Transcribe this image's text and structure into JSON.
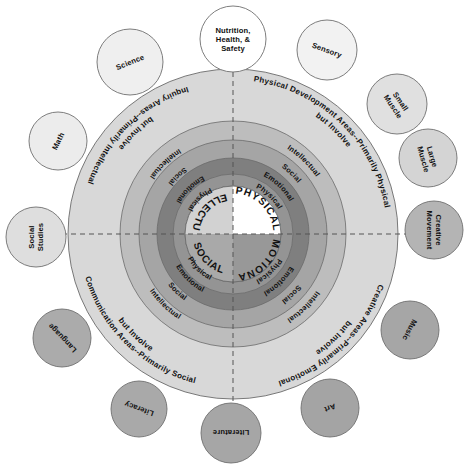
{
  "diagram": {
    "center": {
      "cx": 233,
      "cy": 234
    },
    "core_quadrants": [
      {
        "id": "intellectual",
        "label": "INTELLECTUAL",
        "position": "top-left",
        "color": "#d2d2d2"
      },
      {
        "id": "physical",
        "label": "PHYSICAL",
        "position": "top-right",
        "color": "#ffffff"
      },
      {
        "id": "social",
        "label": "SOCIAL",
        "position": "bottom-left",
        "color": "#a9a9a9"
      },
      {
        "id": "emotional",
        "label": "EMOTIONAL",
        "position": "bottom-right",
        "color": "#989898"
      }
    ],
    "quadrant_sectors": [
      {
        "id": "inquiry",
        "position": "top-left",
        "outer_label": "Inquiry Areas--Primarily Intellectual but Involve",
        "outer_label_line1": "Inquiry Areas--Primarily Intellectual",
        "outer_label_line2": "but Involve",
        "rings_inner_to_outer": [
          "Physical",
          "Emotional",
          "Social",
          "Intellectual"
        ]
      },
      {
        "id": "physical-development",
        "position": "top-right",
        "outer_label": "Physical Development Areas--Primarily Physical but Involve",
        "outer_label_line1": "Physical Development Areas--Primarily Physical",
        "outer_label_line2": "but Involve",
        "rings_inner_to_outer": [
          "Physical",
          "Emotional",
          "Social",
          "Intellectual"
        ]
      },
      {
        "id": "communication",
        "position": "bottom-left",
        "outer_label": "Communication Areas--Primarily Social but Involve",
        "outer_label_line1": "Communication Areas--Primarily Social",
        "outer_label_line2": "but Involve",
        "rings_inner_to_outer": [
          "Physical",
          "Emotional",
          "Social",
          "Intellectual"
        ]
      },
      {
        "id": "creative",
        "position": "bottom-right",
        "outer_label": "Creative Areas--Primarily Emotional but Involve",
        "outer_label_line1": "Creative Areas--Primarily Emotional",
        "outer_label_line2": "but Involve",
        "rings_inner_to_outer": [
          "Physical",
          "Emotional",
          "Social",
          "Intellectual"
        ]
      }
    ],
    "ring_colors": {
      "white_gap": "#ffffff",
      "physical": "#949494",
      "emotional": "#7f7f7f",
      "social": "#a5a5a5",
      "intellectual": "#bdbdbd",
      "outer_label_band": "#d8d8d8",
      "stroke": "#6b6b6b"
    },
    "bubbles": [
      {
        "id": "science",
        "label": "Science",
        "cx": 130,
        "cy": 62,
        "r": 33,
        "fill": "#efefef",
        "rotation": -22,
        "lines": [
          "Science"
        ]
      },
      {
        "id": "nutrition",
        "label": "Nutrition, Health, & Safety",
        "cx": 233,
        "cy": 39,
        "r": 33,
        "fill": "#ffffff",
        "rotation": 0,
        "lines": [
          "Nutrition,",
          "Health, &",
          "Safety"
        ]
      },
      {
        "id": "sensory",
        "label": "Sensory",
        "cx": 327,
        "cy": 50,
        "r": 30,
        "fill": "#f2f2f2",
        "rotation": 20,
        "lines": [
          "Sensory"
        ]
      },
      {
        "id": "small-muscle",
        "label": "Small Muscle",
        "cx": 397,
        "cy": 104,
        "r": 30,
        "fill": "#e0e0e0",
        "rotation": 56,
        "lines": [
          "Small",
          "Muscle"
        ]
      },
      {
        "id": "large-muscle",
        "label": "Large Muscle",
        "cx": 428,
        "cy": 158,
        "r": 29,
        "fill": "#d4d4d4",
        "rotation": 74,
        "lines": [
          "Large",
          "Muscle"
        ]
      },
      {
        "id": "creative-movement",
        "label": "Creative Movement",
        "cx": 434,
        "cy": 230,
        "r": 29,
        "fill": "#b4b4b4",
        "rotation": 90,
        "lines": [
          "Creative",
          "Movement"
        ]
      },
      {
        "id": "music",
        "label": "Music",
        "cx": 410,
        "cy": 330,
        "r": 29,
        "fill": "#a6a6a6",
        "rotation": 118,
        "lines": [
          "Music"
        ]
      },
      {
        "id": "art",
        "label": "Art",
        "cx": 330,
        "cy": 408,
        "r": 29,
        "fill": "#a4a4a4",
        "rotation": 160,
        "lines": [
          "Art"
        ]
      },
      {
        "id": "literature",
        "label": "Literature",
        "cx": 231,
        "cy": 433,
        "r": 30,
        "fill": "#a6a6a6",
        "rotation": 180,
        "lines": [
          "Literature"
        ]
      },
      {
        "id": "literacy",
        "label": "Literacy",
        "cx": 139,
        "cy": 409,
        "r": 28,
        "fill": "#a9a9a9",
        "rotation": 200,
        "lines": [
          "Literacy"
        ]
      },
      {
        "id": "language",
        "label": "Language",
        "cx": 62,
        "cy": 338,
        "r": 29,
        "fill": "#ababab",
        "rotation": 226,
        "lines": [
          "Language"
        ]
      },
      {
        "id": "social-studies",
        "label": "Social Studies",
        "cx": 36,
        "cy": 237,
        "r": 30,
        "fill": "#dedede",
        "rotation": 270,
        "lines": [
          "Social",
          "Studies"
        ]
      },
      {
        "id": "math",
        "label": "Math",
        "cx": 58,
        "cy": 141,
        "r": 29,
        "fill": "#ececec",
        "rotation": 296,
        "lines": [
          "Math"
        ]
      }
    ],
    "axes": {
      "style": "dashed",
      "color": "#555555",
      "vertical": true,
      "horizontal": true
    }
  }
}
